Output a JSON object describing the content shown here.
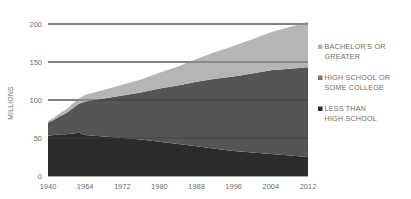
{
  "chart_data": {
    "type": "area",
    "stacked": true,
    "title": "",
    "xlabel": "",
    "ylabel": "MILLIONS",
    "ylim": [
      0,
      200
    ],
    "yticks": [
      0,
      50,
      100,
      150,
      200
    ],
    "ytick_labels": [
      "0",
      "50",
      "100",
      "150",
      "200"
    ],
    "grid": true,
    "legend_position": "right",
    "x": [
      1940,
      1944,
      1948,
      1952,
      1956,
      1960,
      1964,
      1968,
      1972,
      1976,
      1980,
      1984,
      1988,
      1992,
      1996,
      2000,
      2004,
      2008,
      2012
    ],
    "xticks": [
      1940,
      1964,
      1972,
      1980,
      1988,
      1996,
      2004,
      2012
    ],
    "xtick_labels": [
      "1940",
      "1964",
      "1972",
      "1980",
      "1988",
      "1996",
      "2004",
      "2012"
    ],
    "series": [
      {
        "name": "LESS THAN HIGH SCHOOL",
        "color": "#2b2b2b",
        "legend_label_line1": "LESS THAN",
        "legend_label_line2": "HIGH SCHOOL",
        "values": [
          53,
          54,
          55,
          55,
          56,
          57,
          54,
          52,
          50,
          48,
          45,
          42,
          39,
          36,
          33,
          31,
          29,
          27,
          25
        ]
      },
      {
        "name": "HIGH SCHOOL OR SOME COLLEGE",
        "color": "#555555",
        "legend_label_line1": "HIGH SCHOOL OR",
        "legend_label_line2": "SOME COLLEGE",
        "values": [
          17,
          20,
          24,
          28,
          33,
          38,
          44,
          50,
          56,
          62,
          70,
          77,
          85,
          92,
          98,
          104,
          110,
          114,
          118
        ]
      },
      {
        "name": "BACHELOR'S OR GREATER",
        "color": "#b5b5b5",
        "legend_label_line1": "BACHELOR'S OR",
        "legend_label_line2": "GREATER",
        "values": [
          2,
          3,
          4,
          5,
          6,
          7,
          9,
          11,
          14,
          17,
          21,
          25,
          30,
          35,
          40,
          45,
          50,
          55,
          60
        ]
      }
    ],
    "totals": [
      72,
      77,
      83,
      88,
      95,
      102,
      107,
      113,
      120,
      127,
      136,
      144,
      154,
      163,
      171,
      180,
      189,
      196,
      203
    ]
  },
  "legend": {
    "items": [
      {
        "marker": "legend-swatch",
        "line1": "BACHELOR'S OR",
        "line2": "GREATER",
        "color": "#b5b5b5"
      },
      {
        "marker": "legend-swatch",
        "line1": "HIGH SCHOOL OR",
        "line2": "SOME COLLEGE",
        "color": "#777777"
      },
      {
        "marker": "legend-swatch",
        "line1": "LESS THAN",
        "line2": "HIGH SCHOOL",
        "color": "#2b2b2b"
      }
    ]
  },
  "colors": {
    "background": "#ffffff",
    "axis_text": "#6d6d6d",
    "gridline": "#3a3a3a",
    "band_light": "#b5b5b5",
    "band_mid": "#555555",
    "band_dark": "#2b2b2b"
  }
}
